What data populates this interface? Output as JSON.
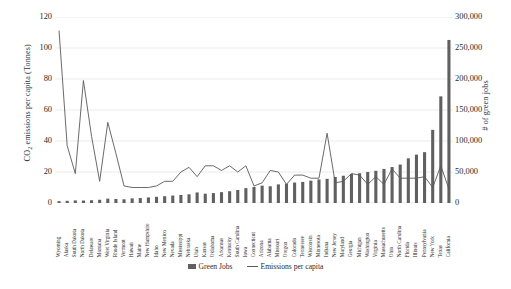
{
  "chart_data": {
    "type": "bar",
    "title": "",
    "subtitle": "",
    "xlabel": "",
    "ylabel": "CO2 emissions per capita (Tonnes)",
    "ylabel_right": "# of green jobs",
    "ylim": [
      0,
      120
    ],
    "ylim_right": [
      0,
      300000
    ],
    "yticks": [
      "0",
      "20",
      "40",
      "60",
      "80",
      "100",
      "120"
    ],
    "yticks_right": [
      "0",
      "50,000",
      "100,000",
      "150,000",
      "200,000",
      "250,000",
      "300,000"
    ],
    "grid": true,
    "legend_position": "bottom",
    "categories": [
      "Wyoming",
      "Alaska",
      "South Dakota",
      "North Dakota",
      "Delaware",
      "Montana",
      "West Virginia",
      "Rhode Island",
      "Vermont",
      "Hawaii",
      "Maine",
      "New Hampshire",
      "Idaho",
      "New Mexico",
      "Nevada",
      "Mississippi",
      "Nebraska",
      "Utah",
      "Kansas",
      "Oklahoma",
      "Arkansas",
      "Kentucky",
      "South Carolina",
      "Iowa",
      "Connecticut",
      "Arizona",
      "Alabama",
      "Missouri",
      "Oregon",
      "Colorado",
      "Tennessee",
      "Wisconsin",
      "Minnesota",
      "Indiana",
      "New Jersey",
      "Maryland",
      "Georgia",
      "Michigan",
      "Washington",
      "Virginia",
      "Massachusetts",
      "Ohio",
      "North Carolina",
      "Florida",
      "Illinois",
      "Pennsylvania",
      "New York",
      "Texas",
      "California"
    ],
    "series": [
      {
        "name": "Green Jobs",
        "axis": "right",
        "type": "bar",
        "color": "#606060",
        "values": [
          3000,
          3500,
          4200,
          4000,
          4500,
          5200,
          7000,
          6500,
          6000,
          7500,
          8000,
          9000,
          10000,
          11000,
          12000,
          13000,
          14000,
          17000,
          15000,
          16000,
          17500,
          19000,
          21000,
          24000,
          26000,
          28000,
          27000,
          30000,
          31000,
          33000,
          34000,
          36000,
          38000,
          39000,
          42000,
          44000,
          47000,
          48000,
          50000,
          52000,
          55000,
          58000,
          62000,
          72000,
          78000,
          82000,
          118000,
          172000,
          263000
        ]
      },
      {
        "name": "Emissions per capita",
        "axis": "left",
        "type": "line",
        "color": "#595959",
        "values": [
          111,
          37,
          19,
          79,
          43,
          14,
          52,
          32,
          11,
          10,
          10,
          10,
          11,
          14,
          14,
          20,
          23,
          17,
          24,
          24,
          21,
          24,
          20,
          24,
          11,
          13,
          21,
          20,
          12,
          18,
          18,
          16,
          16,
          45,
          13,
          14,
          19,
          18,
          12,
          17,
          12,
          22,
          16,
          16,
          16,
          17,
          10,
          24,
          9
        ]
      }
    ]
  },
  "legend": {
    "items": [
      {
        "label": "Green Jobs",
        "marker": "bar-swatch"
      },
      {
        "label": "Emissions per capita",
        "marker": "line-swatch"
      }
    ]
  },
  "axes": {
    "left_title_main": "CO",
    "left_title_sub": "2",
    "left_title_rest": " emissions per capita (Tonnes)",
    "right_title": "# of green jobs"
  }
}
